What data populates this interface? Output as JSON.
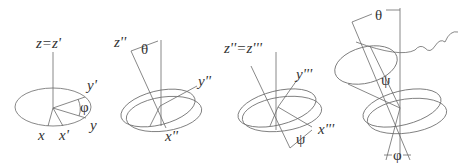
{
  "diagram": {
    "stroke_color": "#6a6a6a",
    "text_color": "#333333",
    "panels": [
      {
        "id": "panel-1",
        "axis_label": "z=z'",
        "labels": {
          "y_prime": "y'",
          "y": "y",
          "x": "x",
          "x_prime": "x'",
          "angle": "φ"
        }
      },
      {
        "id": "panel-2",
        "axis_label": "z''",
        "labels": {
          "angle": "θ",
          "y_dprime": "y''",
          "x_dprime": "x''"
        }
      },
      {
        "id": "panel-3",
        "axis_label": "z''=z'''",
        "labels": {
          "y_tprime": "y'''",
          "x_tprime": "x'''",
          "angle": "ψ"
        }
      },
      {
        "id": "panel-4",
        "labels": {
          "theta": "θ",
          "psi": "ψ",
          "phi": "φ"
        }
      }
    ]
  }
}
